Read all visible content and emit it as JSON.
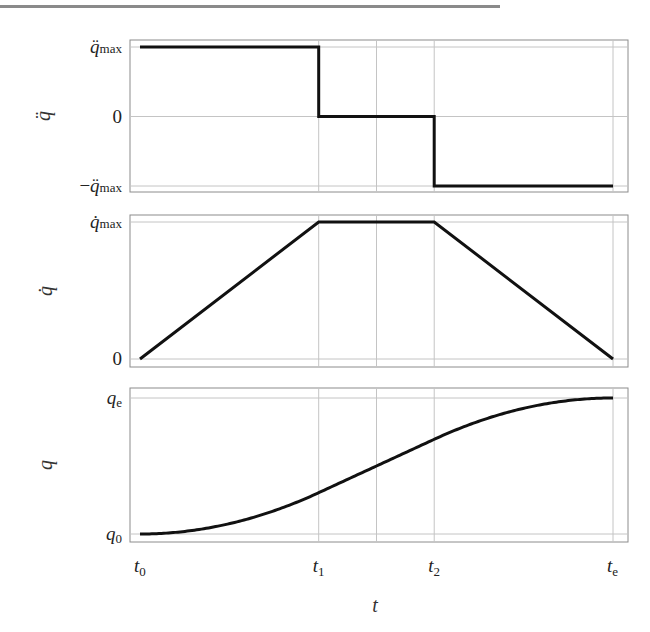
{
  "chart_data": [
    {
      "type": "line",
      "name": "acceleration",
      "ylabel": "q̈",
      "title": "",
      "x_ticks": [
        "t0",
        "t1",
        "t2",
        "te"
      ],
      "y_ticks": [
        {
          "value": 1,
          "base": "q̈",
          "sub": "max",
          "prefix": ""
        },
        {
          "value": 0,
          "base": "0",
          "sub": "",
          "prefix": ""
        },
        {
          "value": -1,
          "base": "q̈",
          "sub": "max",
          "prefix": "−"
        }
      ],
      "ylim": [
        -1,
        1
      ],
      "xlim": [
        0,
        1
      ],
      "x_gridlines": [
        0.3778,
        0.5,
        0.622
      ],
      "x": [
        0,
        0.3778,
        0.3778,
        0.622,
        0.622,
        1
      ],
      "y": [
        1,
        1,
        0,
        0,
        -1,
        -1
      ],
      "grid": true
    },
    {
      "type": "line",
      "name": "velocity",
      "ylabel": "q̇",
      "y_ticks": [
        {
          "value": 1,
          "base": "q̇",
          "sub": "max",
          "prefix": ""
        },
        {
          "value": 0,
          "base": "0",
          "sub": "",
          "prefix": ""
        }
      ],
      "ylim": [
        0,
        1
      ],
      "xlim": [
        0,
        1
      ],
      "x_gridlines": [
        0.3778,
        0.5,
        0.622
      ],
      "x": [
        0,
        0.3778,
        0.622,
        1
      ],
      "y": [
        0,
        1,
        1,
        0
      ],
      "grid": true
    },
    {
      "type": "line",
      "name": "position",
      "ylabel": "q",
      "xlabel": "t",
      "y_ticks": [
        {
          "value": 1,
          "base": "q",
          "sub": "e",
          "prefix": ""
        },
        {
          "value": 0,
          "base": "q",
          "sub": "0",
          "prefix": ""
        }
      ],
      "x_tick_labels": [
        {
          "value": 0,
          "base": "t",
          "sub": "0"
        },
        {
          "value": 0.3778,
          "base": "t",
          "sub": "1"
        },
        {
          "value": 0.622,
          "base": "t",
          "sub": "2"
        },
        {
          "value": 1,
          "base": "t",
          "sub": "e"
        }
      ],
      "ylim": [
        0,
        1
      ],
      "xlim": [
        0,
        1
      ],
      "x_gridlines": [
        0.3778,
        0.5,
        0.622
      ],
      "profile": "trapezoidal-velocity integral (parabolic-linear-parabolic)",
      "grid": true
    }
  ]
}
